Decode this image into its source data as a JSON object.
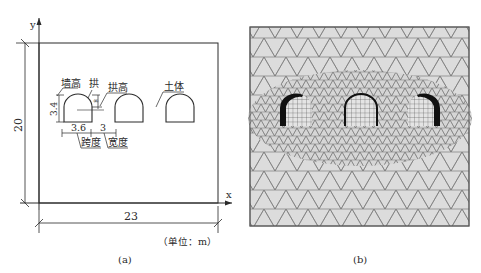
{
  "panel_a": {
    "caption": "(a)",
    "unit_note": "（单位：m）",
    "axes": {
      "x_label": "x",
      "y_label": "y"
    },
    "dimensions": {
      "width_total": "23",
      "height_total": "20",
      "wall_height": "3.4",
      "span": "3.6",
      "spacing": "3",
      "arch_rise": "∞"
    },
    "annotations": {
      "wall_height_label": "墙高",
      "arch_label": "拱",
      "arch_rise_label": "拱高",
      "soil_label": "土体",
      "span_label": "跨度",
      "spacing_label": "宽度"
    },
    "tunnel_count": 3
  },
  "panel_b": {
    "caption": "(b)",
    "description": "Finite element triangular mesh with refined region around three arched tunnels; left and right tunnels have thickened dark lining, structured quad mesh inside tunnels"
  },
  "colors": {
    "line": "#2a2a2a",
    "mesh_fill": "#dcdcdc",
    "mesh_line": "#6a6a6a",
    "lining": "#111111"
  }
}
